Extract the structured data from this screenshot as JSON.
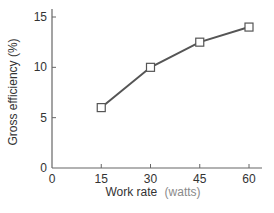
{
  "chart_data": {
    "type": "line",
    "title": "",
    "xlabel": "Work rate",
    "xlabel_unit": "(watts)",
    "ylabel": "Gross efficiency (%)",
    "x": [
      15,
      30,
      45,
      60
    ],
    "series": [
      {
        "name": "Gross efficiency",
        "values": [
          6,
          10,
          12.5,
          14
        ],
        "marker": "open-square"
      }
    ],
    "xlim": [
      0,
      60
    ],
    "ylim": [
      0,
      15
    ],
    "xticks": [
      "0",
      "15",
      "30",
      "45",
      "60"
    ],
    "yticks": [
      "0",
      "5",
      "10",
      "15"
    ],
    "grid": false,
    "legend": null
  },
  "colors": {
    "line": "#555555",
    "axis": "#666666",
    "marker_fill": "#ffffff",
    "text": "#333333",
    "unit_text": "#8a8a8a"
  }
}
